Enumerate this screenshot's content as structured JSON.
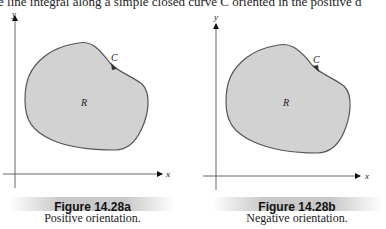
{
  "page": {
    "top_text_fragment": "e line integral along a simple closed curve C oriented in the positive d"
  },
  "figures": [
    {
      "id": "a",
      "caption_title": "Figure 14.28a",
      "caption_subtitle": "Positive orientation.",
      "labels": {
        "x_axis": "x",
        "y_axis": "y",
        "curve": "C",
        "region": "R"
      },
      "orientation": "positive",
      "fill_color": "#d2d2d2",
      "stroke_color": "#555555"
    },
    {
      "id": "b",
      "caption_title": "Figure 14.28b",
      "caption_subtitle": "Negative orientation.",
      "labels": {
        "x_axis": "x",
        "y_axis": "y",
        "curve": "C",
        "region": "R"
      },
      "orientation": "negative",
      "fill_color": "#d2d2d2",
      "stroke_color": "#555555"
    }
  ]
}
